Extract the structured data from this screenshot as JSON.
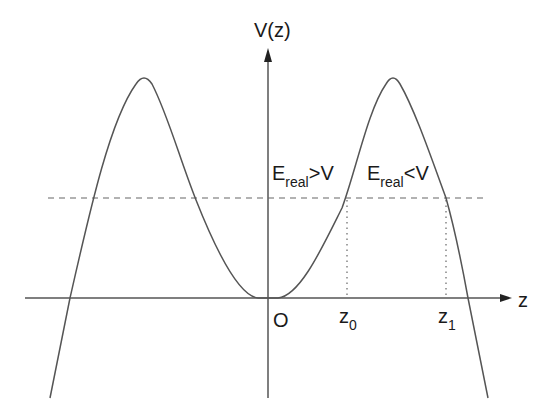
{
  "diagram": {
    "y_axis_label": "V(z)",
    "x_axis_label": "z",
    "origin_label": "O",
    "region_left": {
      "symbol": "E",
      "subscript": "real",
      "relation": ">V"
    },
    "region_right": {
      "symbol": "E",
      "subscript": "real",
      "relation": "<V"
    },
    "turning_points": [
      {
        "symbol": "z",
        "subscript": "0"
      },
      {
        "symbol": "z",
        "subscript": "1"
      }
    ],
    "colors": {
      "curve": "#555555",
      "axes": "#555555",
      "dashed_energy_line": "#666666",
      "text": "#1a1a1a"
    }
  }
}
